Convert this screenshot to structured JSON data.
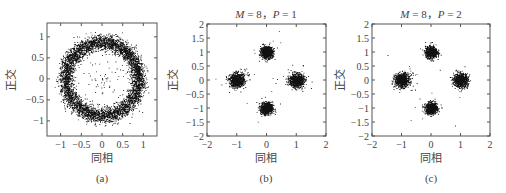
{
  "chart_data": [
    {
      "type": "scatter",
      "panel": "(a)",
      "title": "",
      "xlabel": "同相",
      "ylabel": "正交",
      "xlim": [
        -1.33,
        1.33
      ],
      "ylim": [
        -1.36,
        1.33
      ],
      "xticks": [
        -1,
        -0.5,
        0,
        0.5,
        1
      ],
      "xtick_labels": [
        "−1",
        "−0.5",
        "0",
        "0.5",
        "1"
      ],
      "yticks": [
        1,
        0.5,
        0,
        -0.5,
        -1
      ],
      "ytick_labels": [
        "1",
        "0.5",
        "0",
        "−0.5",
        "−1"
      ],
      "grid": false,
      "description": "Ring-shaped scatter of received symbols, radius ≈ 0.9, spread ≈ ±0.2",
      "ring": {
        "radius": 0.88,
        "sigma": 0.09,
        "count": 5000
      }
    },
    {
      "type": "scatter",
      "panel": "(b)",
      "title": "M = 8，P = 1",
      "xlabel": "同相",
      "ylabel": "正交",
      "xlim": [
        -2,
        2
      ],
      "ylim": [
        -2,
        2
      ],
      "xticks": [
        -2,
        -1,
        0,
        1,
        2
      ],
      "xtick_labels": [
        "−2",
        "−1",
        "0",
        "1",
        "2"
      ],
      "yticks": [
        2,
        1.5,
        1,
        0.5,
        0,
        -0.5,
        -1,
        -1.5,
        -2
      ],
      "ytick_labels": [
        "2",
        "1.5",
        "1",
        "0.5",
        "0",
        "−0.5",
        "−1",
        "−1.5",
        "−2"
      ],
      "grid": false,
      "clusters": [
        {
          "x": 0,
          "y": 1,
          "sigma": 0.1,
          "count": 900
        },
        {
          "x": -1,
          "y": 0,
          "sigma": 0.12,
          "count": 900
        },
        {
          "x": 1,
          "y": 0,
          "sigma": 0.12,
          "count": 900
        },
        {
          "x": 0,
          "y": -1,
          "sigma": 0.1,
          "count": 900
        }
      ],
      "outliers": 60
    },
    {
      "type": "scatter",
      "panel": "(c)",
      "title": "M = 8，P = 2",
      "xlabel": "同相",
      "ylabel": "正交",
      "xlim": [
        -2,
        2
      ],
      "ylim": [
        -2,
        2
      ],
      "xticks": [
        -2,
        -1,
        0,
        1,
        2
      ],
      "xtick_labels": [
        "−2",
        "−1",
        "0",
        "1",
        "2"
      ],
      "yticks": [
        2,
        1.5,
        1,
        0.5,
        0,
        -0.5,
        -1,
        -1.5,
        -2
      ],
      "ytick_labels": [
        "2",
        "1.5",
        "1",
        "0.5",
        "0",
        "−0.5",
        "−1",
        "−1.5",
        "−2"
      ],
      "grid": false,
      "clusters": [
        {
          "x": 0,
          "y": 1,
          "sigma": 0.1,
          "count": 900
        },
        {
          "x": -1,
          "y": 0,
          "sigma": 0.12,
          "count": 900
        },
        {
          "x": 1,
          "y": 0,
          "sigma": 0.12,
          "count": 900
        },
        {
          "x": 0,
          "y": -1,
          "sigma": 0.1,
          "count": 900
        }
      ],
      "outliers": 30
    }
  ],
  "panels": [
    {
      "caption": "(a)",
      "title": "",
      "xlabel": "同相",
      "ylabel": "正交"
    },
    {
      "caption": "(b)",
      "title_m": "M",
      "title_rest_1": " = 8，",
      "title_p": "P",
      "title_rest_2": " = 1",
      "xlabel": "同相",
      "ylabel": "正交"
    },
    {
      "caption": "(c)",
      "title_m": "M",
      "title_rest_1": " = 8，",
      "title_p": "P",
      "title_rest_2": " = 2",
      "xlabel": "同相",
      "ylabel": "正交"
    }
  ],
  "colors": {
    "points": "#111111",
    "axes": "#555555",
    "text": "#444444"
  }
}
